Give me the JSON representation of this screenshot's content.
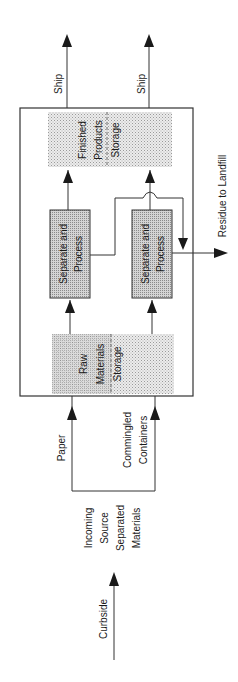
{
  "diagram": {
    "type": "flowchart",
    "orientation": "rotated-90-ccw",
    "nodes": {
      "finished_products_storage": {
        "lines": [
          "Finished",
          "Products",
          "Storage"
        ]
      },
      "separate_process_paper": {
        "lines": [
          "Separate and",
          "Process"
        ]
      },
      "separate_process_containers": {
        "lines": [
          "Separate and",
          "Process"
        ]
      },
      "raw_materials_storage": {
        "lines": [
          "Raw",
          "Materials",
          "Storage"
        ]
      }
    },
    "labels": {
      "ship_1": "Ship",
      "ship_2": "Ship",
      "residue": "Residue to Landfill",
      "paper": "Paper",
      "commingled": [
        "Commingled",
        "Containers"
      ],
      "incoming": [
        "Incoming",
        "Source",
        "Separated",
        "Materials"
      ],
      "curbside": "Curbside"
    },
    "edges": [
      {
        "from": "curbside",
        "to": "incoming"
      },
      {
        "from": "incoming",
        "to": "raw_materials_storage",
        "label": "Paper"
      },
      {
        "from": "incoming",
        "to": "raw_materials_storage",
        "label": "Commingled Containers"
      },
      {
        "from": "raw_materials_storage",
        "to": "separate_process_paper"
      },
      {
        "from": "raw_materials_storage",
        "to": "separate_process_containers"
      },
      {
        "from": "separate_process_paper",
        "to": "finished_products_storage"
      },
      {
        "from": "separate_process_paper",
        "to": "residue"
      },
      {
        "from": "separate_process_containers",
        "to": "finished_products_storage"
      },
      {
        "from": "separate_process_containers",
        "to": "residue"
      },
      {
        "from": "finished_products_storage",
        "to": "ship_1",
        "label": "Ship"
      },
      {
        "from": "finished_products_storage",
        "to": "ship_2",
        "label": "Ship"
      }
    ]
  }
}
